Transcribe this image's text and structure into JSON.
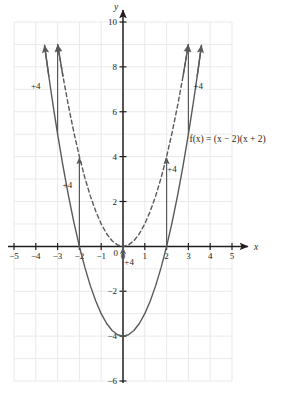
{
  "chart_data": {
    "type": "line",
    "title": "",
    "xlabel": "x",
    "ylabel": "y",
    "xlim": [
      -5,
      5
    ],
    "ylim": [
      -6,
      10
    ],
    "grid": true,
    "grid_step_x": 1,
    "grid_step_y": 1,
    "x_ticks": [
      -5,
      -4,
      -3,
      -2,
      -1,
      0,
      1,
      2,
      3,
      4,
      5
    ],
    "x_tick_labels": [
      "−5",
      "−4",
      "−3",
      "−2",
      "−1",
      "0",
      "1",
      "2",
      "3",
      "4",
      "5"
    ],
    "y_ticks": [
      10,
      8,
      6,
      4,
      2,
      0,
      -2,
      -4,
      -6
    ],
    "y_tick_labels": [
      "10",
      "8",
      "6",
      "4",
      "2",
      "0",
      "−2",
      "−4",
      "−6"
    ],
    "legend_position": "none",
    "series": [
      {
        "name": "parent function",
        "style": "dashed",
        "equation": "y = x^2",
        "vertex": [
          0,
          0
        ],
        "roots": [
          0
        ],
        "x": [
          -3.0,
          -2.75,
          -2.5,
          -2.25,
          -2.0,
          -1.75,
          -1.5,
          -1.25,
          -1.0,
          -0.75,
          -0.5,
          -0.25,
          0.0,
          0.25,
          0.5,
          0.75,
          1.0,
          1.25,
          1.5,
          1.75,
          2.0,
          2.25,
          2.5,
          2.75,
          3.0
        ],
        "y": [
          9.0,
          7.5625,
          6.25,
          5.0625,
          4.0,
          3.0625,
          2.25,
          1.5625,
          1.0,
          0.5625,
          0.25,
          0.0625,
          0.0,
          0.0625,
          0.25,
          0.5625,
          1.0,
          1.5625,
          2.25,
          3.0625,
          4.0,
          5.0625,
          6.25,
          7.5625,
          9.0
        ]
      },
      {
        "name": "transformed function",
        "style": "solid",
        "equation": "f(x) = (x - 2)(x + 2)",
        "vertex": [
          0,
          -4
        ],
        "roots": [
          -2,
          2
        ],
        "x": [
          -3.6,
          -3.4,
          -3.2,
          -3.0,
          -2.75,
          -2.5,
          -2.25,
          -2.0,
          -1.75,
          -1.5,
          -1.25,
          -1.0,
          -0.75,
          -0.5,
          -0.25,
          0.0,
          0.25,
          0.5,
          0.75,
          1.0,
          1.25,
          1.5,
          1.75,
          2.0,
          2.25,
          2.5,
          2.75,
          3.0,
          3.2,
          3.4,
          3.6
        ],
        "y": [
          8.96,
          7.56,
          6.24,
          5.0,
          3.5625,
          2.25,
          1.0625,
          0.0,
          -0.9375,
          -1.75,
          -2.4375,
          -3.0,
          -3.4375,
          -3.75,
          -3.9375,
          -4.0,
          -3.9375,
          -3.75,
          -3.4375,
          -3.0,
          -2.4375,
          -1.75,
          -0.9375,
          0.0,
          1.0625,
          2.25,
          3.5625,
          5.0,
          6.24,
          7.56,
          8.96
        ]
      }
    ],
    "annotations": [
      {
        "id": "shift-outer-left",
        "text": "+4",
        "at_x": -3.0,
        "from_y": 5.0,
        "to_y": 9.0,
        "label_x": -4.0,
        "label_y": 7.0
      },
      {
        "id": "shift-inner-left",
        "text": "+4",
        "at_x": -2.0,
        "from_y": 0.0,
        "to_y": 4.0,
        "label_x": -2.55,
        "label_y": 2.6
      },
      {
        "id": "shift-inner-right",
        "text": "+4",
        "at_x": 2.0,
        "from_y": 0.0,
        "to_y": 4.0,
        "label_x": 2.25,
        "label_y": 3.3
      },
      {
        "id": "shift-outer-right",
        "text": "+4",
        "at_x": 3.0,
        "from_y": 5.0,
        "to_y": 9.0,
        "label_x": 3.45,
        "label_y": 7.0
      },
      {
        "id": "shift-vertex",
        "text": "+4",
        "at_x": 0.0,
        "from_y": -4.0,
        "to_y": 0.0,
        "label_x": 0.28,
        "label_y": -0.85
      }
    ],
    "function_label": {
      "text": "f(x) = (x − 2)(x + 2)",
      "x": 3.05,
      "y": 4.65
    }
  },
  "colors": {
    "curve": "#58595b",
    "axis": "#231f20",
    "grid": "#e9e9ea",
    "text": "#231f20",
    "background": "#ffffff"
  }
}
